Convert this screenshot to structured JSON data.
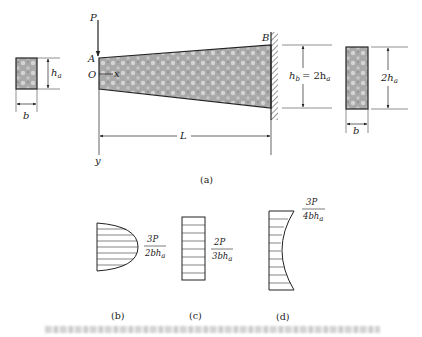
{
  "figure": {
    "part_a": {
      "label": "(a)",
      "load": "P",
      "point_a": "A",
      "point_b": "B",
      "origin": "O",
      "x_axis": "x",
      "y_axis": "y",
      "length": "L",
      "left_section": {
        "height_main": "h",
        "height_sub": "a",
        "width": "b"
      },
      "right_dimension": {
        "text_main": "h",
        "text_sub": "b",
        "eq": "= 2h",
        "eq_sub": "a"
      },
      "right_section": {
        "height_main": "2h",
        "height_sub": "a",
        "width": "b"
      }
    },
    "part_b": {
      "label": "(b)",
      "num": "3P",
      "den_main": "2bh",
      "den_sub": "a",
      "shape": "parabolic"
    },
    "part_c": {
      "label": "(c)",
      "num": "2P",
      "den_main": "3bh",
      "den_sub": "a",
      "shape": "uniform"
    },
    "part_d": {
      "label": "(d)",
      "num": "3P",
      "den_main": "4bh",
      "den_sub": "a",
      "shape": "concave"
    },
    "caption": ""
  }
}
